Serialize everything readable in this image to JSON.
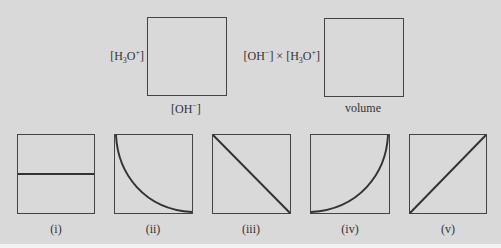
{
  "top_graphs": [
    {
      "id": "graph-a",
      "ylabel_parts": [
        "[H",
        "3",
        "O",
        "+",
        "]"
      ],
      "xlabel_parts": [
        "[OH",
        "−",
        "]"
      ]
    },
    {
      "id": "graph-b",
      "ylabel_parts": [
        "[OH",
        "−",
        "] × [H",
        "3",
        "O",
        "+",
        "]"
      ],
      "xlabel": "volume"
    }
  ],
  "options": [
    {
      "label": "(i)",
      "shape": "horizontal-line"
    },
    {
      "label": "(ii)",
      "shape": "concave-decreasing-curve"
    },
    {
      "label": "(iii)",
      "shape": "decreasing-diagonal"
    },
    {
      "label": "(iv)",
      "shape": "concave-increasing-curve"
    },
    {
      "label": "(v)",
      "shape": "increasing-diagonal"
    }
  ],
  "colors": {
    "background": "#d9d9d9",
    "line": "#333333"
  }
}
